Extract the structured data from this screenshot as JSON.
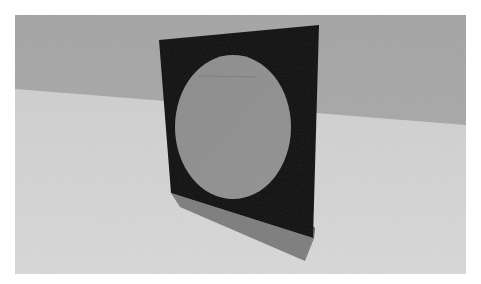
{
  "scene": {
    "description": "3D render of a black square panel with a gray circular disc, standing upright on a light floor against a gray wall, casting a shadow",
    "colors": {
      "border": "#ffffff",
      "wall": "#a9a9a9",
      "floor": "#d3d3d3",
      "panel": "#0f0f0f",
      "disc": "#8e8e8e",
      "shadow": "#6e6e6e"
    }
  }
}
